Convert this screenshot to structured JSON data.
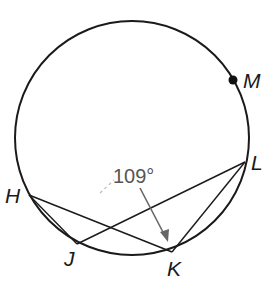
{
  "diagram": {
    "type": "circle-inscribed-angles",
    "circle": {
      "cx": 132,
      "cy": 138,
      "r": 117,
      "stroke": "#1a1a1a"
    },
    "points": {
      "H": {
        "label": "H",
        "x": 29,
        "y": 195
      },
      "J": {
        "label": "J",
        "x": 77,
        "y": 244
      },
      "K": {
        "label": "K",
        "x": 172,
        "y": 252
      },
      "L": {
        "label": "L",
        "x": 245,
        "y": 162
      },
      "M": {
        "label": "M",
        "x": 233,
        "y": 80
      }
    },
    "segments": [
      [
        "H",
        "J"
      ],
      [
        "H",
        "K"
      ],
      [
        "J",
        "L"
      ],
      [
        "K",
        "L"
      ]
    ],
    "angle_annotation": {
      "text": "109°",
      "color": "#555555",
      "points_to": "K"
    }
  }
}
